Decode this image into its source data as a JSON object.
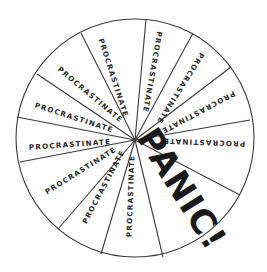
{
  "diagram": {
    "type": "wheel",
    "center": [
      135,
      140
    ],
    "circle": {
      "cx": 135,
      "cy": 138,
      "r": 119
    },
    "spoke_ends": [
      [
        146,
        19
      ],
      [
        193,
        33
      ],
      [
        231,
        67
      ],
      [
        250,
        120
      ],
      [
        240,
        195
      ],
      [
        163,
        257
      ],
      [
        101,
        254
      ],
      [
        58,
        229
      ],
      [
        20,
        162
      ],
      [
        17,
        117
      ],
      [
        37,
        74
      ],
      [
        81,
        33
      ]
    ],
    "segments": [
      {
        "label": "PROCRASTINATE",
        "x": 113,
        "y": 78,
        "rot": 72
      },
      {
        "label": "PROCRASTINATE",
        "x": 152,
        "y": 72,
        "rot": 100
      },
      {
        "label": "PROCRASTINATE",
        "x": 180,
        "y": 88,
        "rot": 122
      },
      {
        "label": "PROCRASTINATE",
        "x": 198,
        "y": 112,
        "rot": 152
      },
      {
        "label": "PROCRASTINATE",
        "x": 204,
        "y": 142,
        "rot": 182
      },
      {
        "label": "PROCRASTINATE",
        "x": 131,
        "y": 196,
        "rot": -88
      },
      {
        "label": "PROCRASTINATE",
        "x": 104,
        "y": 187,
        "rot": -62
      },
      {
        "label": "PROCRASTINATE",
        "x": 81,
        "y": 171,
        "rot": -32
      },
      {
        "label": "PROCRASTINATE",
        "x": 70,
        "y": 145,
        "rot": -4
      },
      {
        "label": "PROCRASTINATE",
        "x": 74,
        "y": 118,
        "rot": 18
      },
      {
        "label": "PROCRASTINATE",
        "x": 90,
        "y": 95,
        "rot": 40
      }
    ],
    "panic": {
      "label": "PANIC!",
      "x": 180,
      "y": 190,
      "rot": 58
    }
  }
}
